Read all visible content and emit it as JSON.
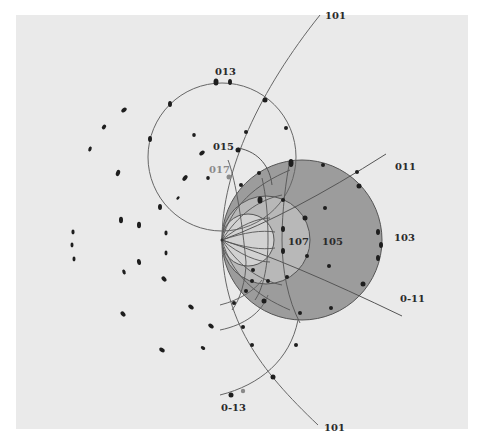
{
  "figure": {
    "type": "stereographic projection of diffraction poles",
    "colors": {
      "page": "#ffffff",
      "paper": "#eaeaea",
      "outer_zone": "#9c9c9c",
      "middle_zone": "#b8b8b8",
      "inner_zone": "#d2d2d2",
      "line": "#555555",
      "spot": "#1e1e1e",
      "faint_spot": "#8a8a8a"
    },
    "labels": {
      "top_101": "101",
      "pole_013": "013",
      "pole_015": "015",
      "pole_017": "017",
      "pole_011": "011",
      "pole_103": "103",
      "pole_107": "107",
      "pole_105": "105",
      "pole_0m11": "0-11",
      "pole_0m13": "0-13",
      "bottom_101": "101"
    }
  }
}
